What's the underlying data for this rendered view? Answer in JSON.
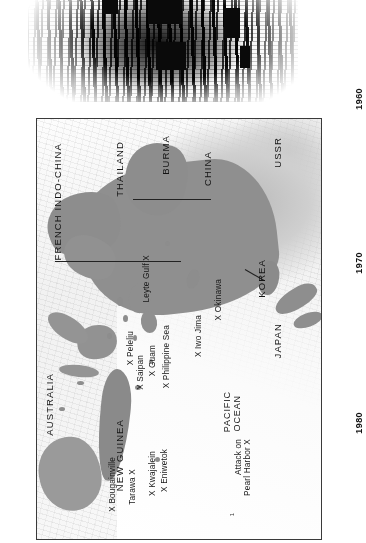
{
  "page": {
    "orientation": "rotated-90-clockwise",
    "background_color": "#ffffff",
    "ink_color": "#141414"
  },
  "photo": {
    "caption": "",
    "alt_name": "halftone-scanned-photograph"
  },
  "timeline": {
    "years": [
      "1960",
      "1970",
      "1980"
    ]
  },
  "map": {
    "frame_border_color": "#3a3a3a",
    "land_shade_color": "#8e8e8e",
    "countries": [
      {
        "name": "USSR"
      },
      {
        "name": "CHINA"
      },
      {
        "name": "BURMA"
      },
      {
        "name": "THAILAND"
      },
      {
        "name": "FRENCH INDO-CHINA"
      },
      {
        "name": "KOREA"
      },
      {
        "name": "JAPAN"
      },
      {
        "name": "NEW GUINEA"
      },
      {
        "name": "AUSTRALIA"
      }
    ],
    "oceans": [
      {
        "line1": "PACIFIC",
        "line2": "OCEAN"
      }
    ],
    "battles": [
      {
        "label": "Leyte Gulf X"
      },
      {
        "label": "X Okinawa"
      },
      {
        "label": "X Iwo Jima"
      },
      {
        "label": "X Philippine Sea"
      },
      {
        "label": "X Guam"
      },
      {
        "label": "X Saipan"
      },
      {
        "label": "X Peleliu"
      },
      {
        "label": "X Eniwetok"
      },
      {
        "label": "X Kwajalein"
      },
      {
        "label": "Tarawa X"
      },
      {
        "label": "X Bougainville"
      },
      {
        "label": "Attack on\nPearl Harbor X"
      }
    ],
    "footnote_marker": "1"
  }
}
